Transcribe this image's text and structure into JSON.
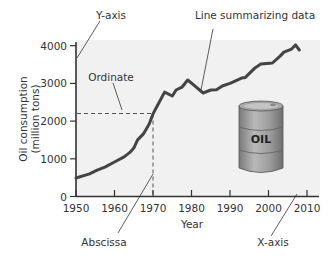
{
  "chart_data": {
    "type": "line",
    "title": "",
    "xlabel": "Year",
    "ylabel": "Oil consumption (million tons)",
    "ylabel_lines": [
      "Oil consumption",
      "(million tons)"
    ],
    "xlim": [
      1950,
      2012
    ],
    "ylim": [
      0,
      4200
    ],
    "xticks": [
      1950,
      1960,
      1970,
      1980,
      1990,
      2000,
      2010
    ],
    "yticks": [
      0,
      1000,
      2000,
      3000,
      4000
    ],
    "grid": false,
    "legend": null,
    "series": [
      {
        "name": "Oil consumption",
        "x": [
          1950,
          1953.5,
          1955.5,
          1957.5,
          1960,
          1962.5,
          1964,
          1965,
          1966,
          1967.5,
          1969,
          1970,
          1971.5,
          1973,
          1975,
          1976,
          1977.5,
          1979,
          1981,
          1983,
          1985,
          1986.5,
          1988,
          1990,
          1993,
          1994,
          1996.5,
          1998,
          2001,
          2003,
          2004,
          2006,
          2007,
          2008
        ],
        "values": [
          490,
          600,
          700,
          780,
          915,
          1050,
          1170,
          1285,
          1500,
          1660,
          1920,
          2190,
          2480,
          2770,
          2665,
          2825,
          2900,
          3090,
          2920,
          2745,
          2825,
          2830,
          2930,
          3000,
          3140,
          3160,
          3410,
          3515,
          3540,
          3725,
          3830,
          3910,
          4020,
          3885
        ]
      }
    ],
    "annotations": [
      {
        "text": "Y-axis",
        "points_to": "y-axis"
      },
      {
        "text": "Line summarizing data",
        "points_to": "data line near 1983"
      },
      {
        "text": "Ordinate",
        "points_to": "dashed horizontal guide at y=2200"
      },
      {
        "text": "Abscissa",
        "points_to": "dashed vertical guide at x=1970"
      },
      {
        "text": "X-axis",
        "points_to": "x-axis"
      },
      {
        "text": "OIL",
        "points_to": "oil barrel illustration"
      }
    ],
    "guides": {
      "ordinate_value": 2200,
      "abscissa_value": 1970
    }
  },
  "labels": {
    "y_axis": "Y-axis",
    "x_axis": "X-axis",
    "line_summary": "Line summarizing data",
    "ordinate": "Ordinate",
    "abscissa": "Abscissa",
    "barrel": "OIL",
    "xlabel": "Year",
    "ylabel_line1": "Oil consumption",
    "ylabel_line2": "(million tons)"
  },
  "colors": {
    "plot_bg": "#f1f1f1",
    "line": "#444444",
    "axis": "#333333",
    "barrel": "#9a9a9a"
  }
}
